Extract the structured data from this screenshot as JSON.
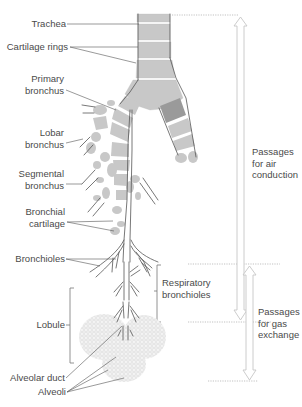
{
  "diagram": {
    "type": "anatomical-illustration",
    "colors": {
      "cartilage": "#c8c8c8",
      "cartilage_dark": "#9a9a9a",
      "outline": "#555555",
      "leader_line": "#555555",
      "arrow": "#c8c8c8",
      "dotted_guide": "#999999",
      "alveoli": "#d6d6d6",
      "text": "#4a4a4a"
    },
    "left_labels": [
      {
        "id": "trachea",
        "text": "Trachea"
      },
      {
        "id": "cartilage-rings",
        "text": "Cartilage rings"
      },
      {
        "id": "primary-bronchus",
        "text": "Primary\nbronchus"
      },
      {
        "id": "lobar-bronchus",
        "text": "Lobar\nbronchus"
      },
      {
        "id": "segmental-bronchus",
        "text": "Segmental\nbronchus"
      },
      {
        "id": "bronchial-cartilage",
        "text": "Bronchial\ncartilage"
      },
      {
        "id": "bronchioles",
        "text": "Bronchioles"
      },
      {
        "id": "lobule",
        "text": "Lobule"
      },
      {
        "id": "alveolar-duct",
        "text": "Alveolar duct"
      },
      {
        "id": "alveoli",
        "text": "Alveoli"
      }
    ],
    "right_labels": [
      {
        "id": "respiratory-bronchioles",
        "text": "Respiratory\nbronchioles"
      },
      {
        "id": "air-conduction",
        "text": "Passages\nfor air\nconduction"
      },
      {
        "id": "gas-exchange",
        "text": "Passages\nfor gas\nexchange"
      }
    ]
  }
}
